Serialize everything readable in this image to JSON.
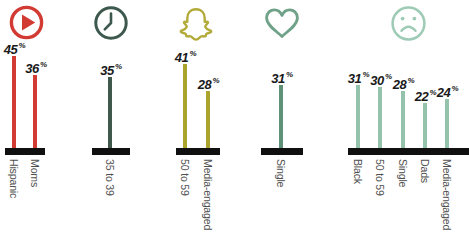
{
  "chart_data": {
    "type": "bar",
    "title": "",
    "orientation": "vertical",
    "value_suffix": "%",
    "ylim": [
      0,
      50
    ],
    "grid": false,
    "legend": false,
    "colors": {
      "axis": "#101010",
      "value_label": "#1a1a1a",
      "category_label": "#4f4f4f",
      "background": "#ffffff"
    },
    "groups": [
      {
        "icon": "play-icon",
        "icon_color": "#d23b33",
        "bar_color": "#d23b33",
        "categories": [
          "Hispanic",
          "Moms"
        ],
        "values": [
          45,
          36
        ]
      },
      {
        "icon": "clock-icon",
        "icon_color": "#3d594e",
        "bar_color": "#41594d",
        "categories": [
          "35 to 39"
        ],
        "values": [
          35
        ]
      },
      {
        "icon": "snapchat-ghost-icon",
        "icon_color": "#b2aa39",
        "bar_color": "#aaa32e",
        "categories": [
          "50 to 59",
          "Media-engaged"
        ],
        "values": [
          41,
          28
        ]
      },
      {
        "icon": "heart-icon",
        "icon_color": "#6fa288",
        "bar_color": "#5f9078",
        "categories": [
          "Single"
        ],
        "values": [
          31
        ]
      },
      {
        "icon": "sad-face-icon",
        "icon_color": "#9ecbb6",
        "bar_color": "#95c2ab",
        "categories": [
          "Black",
          "50 to 59",
          "Single",
          "Dads",
          "Media-engaged"
        ],
        "values": [
          31,
          30,
          28,
          22,
          24
        ]
      }
    ]
  }
}
